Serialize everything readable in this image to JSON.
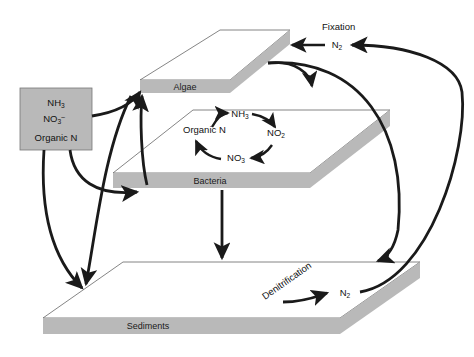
{
  "diagram": {
    "title_hidden": "",
    "colors": {
      "slab_fill": "#b9b9b9",
      "slab_top": "#ffffff",
      "outline": "#555555",
      "arrow": "#1a1a1a",
      "box_fill": "#b9b9b9",
      "background": "#ffffff"
    },
    "source_box": {
      "name": "nutrient-source-box",
      "lines": [
        {
          "base": "NH",
          "sub": "3",
          "sup": ""
        },
        {
          "base": "NO",
          "sub": "3",
          "sup": "–"
        },
        {
          "base": "Organic N",
          "sub": "",
          "sup": ""
        }
      ]
    },
    "slabs": [
      {
        "id": "algae",
        "label": "Algae"
      },
      {
        "id": "bacteria",
        "label": "Bacteria"
      },
      {
        "id": "sediments",
        "label": "Sediments"
      }
    ],
    "cycle": {
      "name": "nitrogen-cycle-on-bacteria",
      "nodes": [
        {
          "id": "organic-n",
          "base": "Organic N",
          "sub": ""
        },
        {
          "id": "nh3",
          "base": "NH",
          "sub": "3"
        },
        {
          "id": "no2",
          "base": "NO",
          "sub": "2"
        },
        {
          "id": "no3",
          "base": "NO",
          "sub": "3"
        }
      ],
      "direction": "clockwise"
    },
    "process_labels": [
      {
        "id": "fixation",
        "text": "Fixation"
      },
      {
        "id": "denitrification",
        "text": "Denitrification"
      }
    ],
    "gas_nodes": [
      {
        "id": "n2-fixation",
        "base": "N",
        "sub": "2"
      },
      {
        "id": "n2-denitrification",
        "base": "N",
        "sub": "2"
      }
    ]
  }
}
